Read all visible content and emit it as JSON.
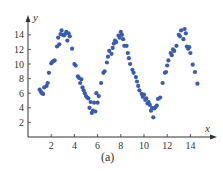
{
  "caption": "(a)",
  "colors": {
    "point": "#3a5bb5",
    "axis": "#333333"
  },
  "chart_data": {
    "type": "scatter",
    "title": "",
    "xlabel": "x",
    "ylabel": "y",
    "xlim": [
      0,
      15.5
    ],
    "ylim": [
      0,
      15.5
    ],
    "xticks": [
      2,
      4,
      6,
      8,
      10,
      12,
      14
    ],
    "yticks": [
      2,
      4,
      6,
      8,
      10,
      12,
      14
    ],
    "grid": false,
    "legend": null,
    "caption": "(a)",
    "points": [
      [
        1.0,
        6.5
      ],
      [
        1.1,
        6.2
      ],
      [
        1.2,
        6.0
      ],
      [
        1.3,
        5.9
      ],
      [
        1.4,
        6.8
      ],
      [
        1.6,
        7.0
      ],
      [
        1.7,
        7.4
      ],
      [
        1.8,
        8.8
      ],
      [
        2.0,
        10.1
      ],
      [
        2.1,
        10.3
      ],
      [
        2.2,
        10.4
      ],
      [
        2.3,
        10.5
      ],
      [
        2.5,
        12.4
      ],
      [
        2.6,
        13.6
      ],
      [
        2.7,
        12.7
      ],
      [
        2.8,
        14.1
      ],
      [
        2.9,
        14.6
      ],
      [
        3.0,
        14.0
      ],
      [
        3.1,
        13.9
      ],
      [
        3.2,
        14.1
      ],
      [
        3.3,
        14.4
      ],
      [
        3.4,
        13.2
      ],
      [
        3.5,
        14.2
      ],
      [
        3.6,
        13.8
      ],
      [
        3.8,
        12.1
      ],
      [
        4.0,
        10.0
      ],
      [
        4.1,
        9.8
      ],
      [
        4.3,
        8.3
      ],
      [
        4.4,
        8.1
      ],
      [
        4.5,
        7.4
      ],
      [
        4.6,
        7.9
      ],
      [
        4.7,
        6.8
      ],
      [
        4.8,
        6.4
      ],
      [
        4.9,
        6.0
      ],
      [
        5.0,
        5.6
      ],
      [
        5.1,
        5.4
      ],
      [
        5.2,
        5.3
      ],
      [
        5.3,
        4.0
      ],
      [
        5.4,
        4.8
      ],
      [
        5.5,
        3.3
      ],
      [
        5.6,
        3.6
      ],
      [
        5.7,
        4.7
      ],
      [
        5.8,
        3.5
      ],
      [
        5.9,
        6.0
      ],
      [
        6.0,
        4.7
      ],
      [
        6.1,
        5.6
      ],
      [
        6.3,
        7.4
      ],
      [
        6.5,
        8.8
      ],
      [
        6.6,
        9.0
      ],
      [
        6.8,
        10.2
      ],
      [
        6.9,
        11.0
      ],
      [
        7.0,
        11.8
      ],
      [
        7.2,
        11.4
      ],
      [
        7.3,
        12.2
      ],
      [
        7.4,
        12.8
      ],
      [
        7.5,
        13.2
      ],
      [
        7.6,
        13.0
      ],
      [
        7.8,
        13.9
      ],
      [
        7.9,
        13.6
      ],
      [
        8.0,
        14.4
      ],
      [
        8.1,
        14.0
      ],
      [
        8.2,
        13.4
      ],
      [
        8.3,
        12.5
      ],
      [
        8.5,
        12.5
      ],
      [
        8.6,
        11.5
      ],
      [
        8.7,
        10.8
      ],
      [
        8.8,
        10.0
      ],
      [
        9.0,
        9.2
      ],
      [
        9.1,
        8.8
      ],
      [
        9.3,
        8.2
      ],
      [
        9.4,
        7.6
      ],
      [
        9.5,
        7.0
      ],
      [
        9.6,
        6.4
      ],
      [
        9.8,
        5.9
      ],
      [
        9.9,
        5.5
      ],
      [
        10.0,
        5.8
      ],
      [
        10.1,
        5.1
      ],
      [
        10.2,
        5.3
      ],
      [
        10.3,
        4.6
      ],
      [
        10.4,
        4.8
      ],
      [
        10.5,
        4.4
      ],
      [
        10.6,
        3.6
      ],
      [
        10.7,
        4.0
      ],
      [
        10.8,
        2.7
      ],
      [
        10.9,
        3.9
      ],
      [
        11.0,
        4.1
      ],
      [
        11.1,
        4.3
      ],
      [
        11.2,
        5.2
      ],
      [
        11.4,
        5.4
      ],
      [
        11.6,
        7.4
      ],
      [
        11.8,
        8.8
      ],
      [
        11.9,
        8.9
      ],
      [
        12.0,
        9.8
      ],
      [
        12.1,
        10.5
      ],
      [
        12.3,
        11.5
      ],
      [
        12.4,
        11.2
      ],
      [
        12.5,
        12.0
      ],
      [
        12.6,
        11.8
      ],
      [
        12.8,
        12.5
      ],
      [
        13.0,
        14.0
      ],
      [
        13.1,
        13.8
      ],
      [
        13.2,
        14.6
      ],
      [
        13.4,
        13.4
      ],
      [
        13.5,
        14.8
      ],
      [
        13.6,
        14.2
      ],
      [
        13.7,
        12.4
      ],
      [
        13.8,
        12.1
      ],
      [
        13.9,
        12.3
      ],
      [
        14.0,
        11.5
      ],
      [
        14.2,
        9.9
      ],
      [
        14.4,
        8.9
      ],
      [
        14.6,
        7.3
      ]
    ]
  }
}
